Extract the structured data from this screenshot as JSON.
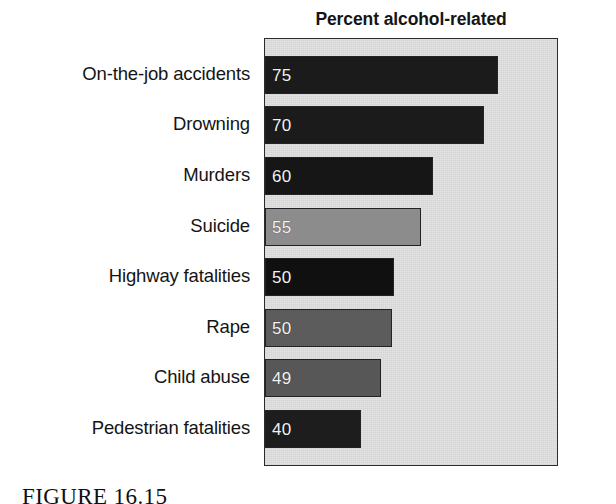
{
  "figure": {
    "caption": "FIGURE 16.15",
    "panel_bg": "#e2e2e2",
    "panel_border": "#2b2b2b"
  },
  "chart_data": {
    "type": "bar",
    "orientation": "horizontal",
    "title": "Percent alcohol-related",
    "xlabel": "",
    "ylabel": "",
    "xlim": [
      0,
      100
    ],
    "grid": false,
    "legend": null,
    "value_labels_inside_bars": true,
    "categories": [
      "On-the-job accidents",
      "Drowning",
      "Murders",
      "Suicide",
      "Highway fatalities",
      "Rape",
      "Child abuse",
      "Pedestrian fatalities"
    ],
    "values": [
      75,
      70,
      60,
      55,
      50,
      50,
      49,
      40
    ],
    "value_labels": [
      "75",
      "70",
      "60",
      "55",
      "50",
      "50",
      "49",
      "40"
    ],
    "bar_colors": [
      "#1b1b1b",
      "#1b1b1b",
      "#161616",
      "#8c8c8c",
      "#101010",
      "#5c5c5c",
      "#575757",
      "#1d1d1d"
    ],
    "bar_pixel_widths": [
      233,
      219,
      168,
      156,
      129,
      127,
      116,
      96
    ],
    "bar_row_tops": [
      55,
      105,
      156,
      207,
      257,
      308,
      358,
      409
    ],
    "value_text_color": "#f2f2f2"
  }
}
